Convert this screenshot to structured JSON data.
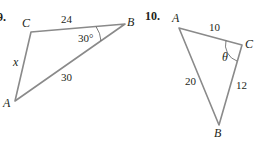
{
  "problems": [
    {
      "number": "9.",
      "vertices": {
        "A": "A",
        "B": "B",
        "C": "C"
      },
      "sides": {
        "CB": "24",
        "AB": "30",
        "AC": "x"
      },
      "angle_label": "30°",
      "angle_at": "B"
    },
    {
      "number": "10.",
      "vertices": {
        "A": "A",
        "B": "B",
        "C": "C"
      },
      "sides": {
        "AC": "10",
        "AB": "20",
        "CB": "12"
      },
      "angle_label": "θ",
      "angle_at": "C"
    }
  ],
  "colors": {
    "edge": "#8a8a8a",
    "text": "#231f20"
  }
}
